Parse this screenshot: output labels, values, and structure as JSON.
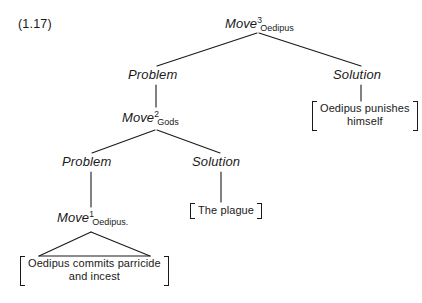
{
  "figure": {
    "label": "(1.17)",
    "width": 422,
    "height": 303,
    "ink_color": "#1a1a1a",
    "background": "#ffffff"
  },
  "tree": {
    "root": {
      "name": "move-3-oedipus",
      "base": "Move",
      "superscript": "3",
      "subscript": "Oedipus"
    },
    "level1": {
      "problem": "Problem",
      "solution": "Solution",
      "solution_terminal": {
        "line1": "Oedipus punishes",
        "line2": "himself"
      }
    },
    "level2": {
      "move": {
        "name": "move-2-gods",
        "base": "Move",
        "superscript": "2",
        "subscript": "Gods"
      },
      "problem": "Problem",
      "solution": "Solution",
      "solution_terminal": {
        "line1": "The plague"
      }
    },
    "level3": {
      "move": {
        "name": "move-1-oedipus",
        "base": "Move",
        "superscript": "1",
        "subscript": "Oedipus."
      },
      "terminal": {
        "line1": "Oedipus commits parricide",
        "line2": "and incest"
      }
    }
  }
}
